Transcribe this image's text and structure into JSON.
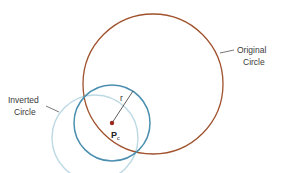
{
  "diagram": {
    "labels": {
      "original_line1": "Original",
      "original_line2": "Circle",
      "inverted_line1": "Inverted",
      "inverted_line2": "Circle",
      "radius": "r",
      "center_main": "P",
      "center_sub": "c"
    },
    "colors": {
      "original_circle": "#a0522d",
      "inversion_circle": "#4a8fb0",
      "inverted_circle": "#bcd9e4",
      "center_point": "#9b2a1e",
      "leader": "#555555"
    }
  }
}
